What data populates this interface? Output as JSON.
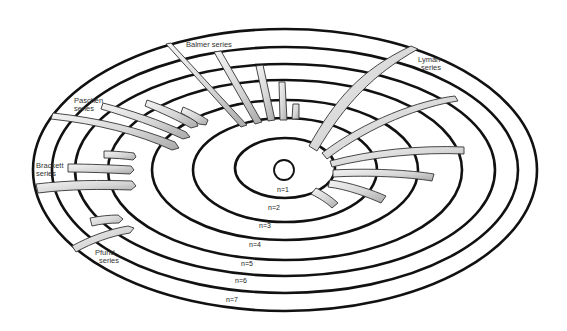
{
  "diagram": {
    "nucleus": {
      "label": ""
    },
    "orbits": [
      {
        "n": 1,
        "label": "n=1"
      },
      {
        "n": 2,
        "label": "n=2"
      },
      {
        "n": 3,
        "label": "n=3"
      },
      {
        "n": 4,
        "label": "n=4"
      },
      {
        "n": 5,
        "label": "n=5"
      },
      {
        "n": 6,
        "label": "n=6"
      },
      {
        "n": 7,
        "label": "n=7"
      }
    ],
    "series": [
      {
        "name": "Lyman",
        "label_line1": "Lyman",
        "label_line2": "series",
        "final_n": 1,
        "transitions": 6
      },
      {
        "name": "Balmer",
        "label_line1": "Balmer series",
        "label_line2": "",
        "final_n": 2,
        "transitions": 5
      },
      {
        "name": "Paschen",
        "label_line1": "Paschen",
        "label_line2": "series",
        "final_n": 3,
        "transitions": 4
      },
      {
        "name": "Brackett",
        "label_line1": "Brackett",
        "label_line2": "series",
        "final_n": 4,
        "transitions": 3
      },
      {
        "name": "Pfund",
        "label_line1": "Pfund",
        "label_line2": "series",
        "final_n": 5,
        "transitions": 2
      }
    ],
    "colors": {
      "orbit_stroke": "#111111",
      "band_light": "#f2f2f2",
      "band_dark": "#b8b8b8",
      "background": "#ffffff"
    }
  }
}
